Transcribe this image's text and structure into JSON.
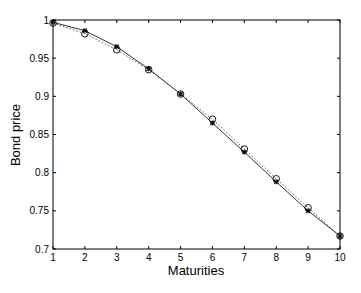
{
  "chart_data": {
    "type": "line",
    "title": "",
    "xlabel": "Maturities",
    "ylabel": "Bond price",
    "xlim": [
      1,
      10
    ],
    "ylim": [
      0.7,
      1.0
    ],
    "grid": false,
    "legend": null,
    "x": [
      1,
      2,
      3,
      4,
      5,
      6,
      7,
      8,
      9,
      10
    ],
    "xticks": [
      "1",
      "2",
      "3",
      "4",
      "5",
      "6",
      "7",
      "8",
      "9",
      "10"
    ],
    "yticks": [
      "0.7",
      "0.75",
      "0.8",
      "0.85",
      "0.9",
      "0.95",
      "1"
    ],
    "series": [
      {
        "name": "fitted",
        "style": "solid line with star markers",
        "color": "#000000",
        "values": [
          0.997,
          0.986,
          0.965,
          0.936,
          0.903,
          0.865,
          0.827,
          0.788,
          0.75,
          0.717
        ]
      },
      {
        "name": "observed",
        "style": "dotted line with circle markers",
        "color": "#000000",
        "values": [
          0.996,
          0.982,
          0.961,
          0.935,
          0.903,
          0.87,
          0.831,
          0.792,
          0.754,
          0.717
        ]
      }
    ]
  }
}
